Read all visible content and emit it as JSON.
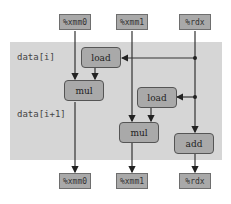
{
  "diagram": {
    "type": "dataflow",
    "inputs": [
      {
        "id": "in-xmm0",
        "label": "%xmm0"
      },
      {
        "id": "in-xmm1",
        "label": "%xmm1"
      },
      {
        "id": "in-rdx",
        "label": "%rdx"
      }
    ],
    "outputs": [
      {
        "id": "out-xmm0",
        "label": "%xmm0"
      },
      {
        "id": "out-xmm1",
        "label": "%xmm1"
      },
      {
        "id": "out-rdx",
        "label": "%rdx"
      }
    ],
    "row_labels": {
      "first": "data[i]",
      "second": "data[i+1]"
    },
    "operations": [
      {
        "id": "load1",
        "label": "load"
      },
      {
        "id": "mul1",
        "label": "mul"
      },
      {
        "id": "load2",
        "label": "load"
      },
      {
        "id": "mul2",
        "label": "mul"
      },
      {
        "id": "add",
        "label": "add"
      }
    ],
    "edges": [
      {
        "from": "in-xmm0",
        "to": "mul1"
      },
      {
        "from": "in-rdx",
        "to": "load1"
      },
      {
        "from": "load1",
        "to": "mul1"
      },
      {
        "from": "mul1",
        "to": "out-xmm0"
      },
      {
        "from": "in-xmm1",
        "to": "mul2"
      },
      {
        "from": "in-rdx",
        "to": "load2"
      },
      {
        "from": "load2",
        "to": "mul2"
      },
      {
        "from": "mul2",
        "to": "out-xmm1"
      },
      {
        "from": "in-rdx",
        "to": "add"
      },
      {
        "from": "add",
        "to": "out-rdx"
      }
    ],
    "colors": {
      "background_region": "#d6d6d6",
      "box_fill": "#a9a9a9",
      "line": "#333333"
    }
  }
}
